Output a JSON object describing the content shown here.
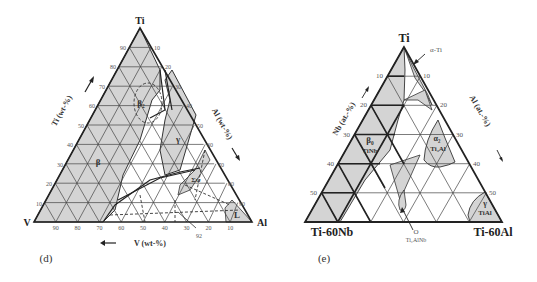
{
  "panels": [
    {
      "id": "d",
      "panel_label": "(d)",
      "corners": {
        "top": "Ti",
        "left": "V",
        "right": "Al"
      },
      "axes": {
        "left_axis_title": "Ti (wt-%)",
        "right_axis_title": "Al (wt-%)",
        "bottom_axis_title": "V (wt-%)",
        "left_ticks": [
          "10",
          "20",
          "30",
          "40",
          "50",
          "60",
          "70",
          "80",
          "90"
        ],
        "right_ticks": [
          "10",
          "20",
          "30",
          "40",
          "50",
          "60",
          "70",
          "80",
          "90"
        ],
        "bottom_ticks": [
          "90",
          "80",
          "70",
          "60",
          "50",
          "40",
          "30",
          "20",
          "10"
        ]
      },
      "phases": [
        {
          "name": "β",
          "label": "β"
        },
        {
          "name": "β2",
          "label": "β₂"
        },
        {
          "name": "γ",
          "label": "γ"
        },
        {
          "name": "Σψ",
          "label": "Σψ"
        },
        {
          "name": "L",
          "label": "L"
        },
        {
          "name": "D",
          "label": "D"
        }
      ],
      "annotation": "92"
    },
    {
      "id": "e",
      "panel_label": "(e)",
      "corners": {
        "top": "Ti",
        "left": "Ti-60Nb",
        "right": "Ti-60Al"
      },
      "axes": {
        "left_axis_title": "Nb (at.-%)",
        "right_axis_title": "Al (at.-%)",
        "left_ticks": [
          "10",
          "20",
          "30",
          "40",
          "50"
        ],
        "right_ticks": [
          "10",
          "20",
          "30",
          "40",
          "50"
        ]
      },
      "phases": [
        {
          "name": "alpha-Ti",
          "label": "α-Ti"
        },
        {
          "name": "beta0",
          "label": "β₀",
          "sublabel": "TiNb"
        },
        {
          "name": "alpha2",
          "label": "α₂",
          "sublabel": "Ti₃Al"
        },
        {
          "name": "gamma",
          "label": "γ",
          "sublabel": "TiAl"
        },
        {
          "name": "O",
          "label": "O",
          "sublabel": "Ti₂AlNb"
        }
      ]
    }
  ]
}
